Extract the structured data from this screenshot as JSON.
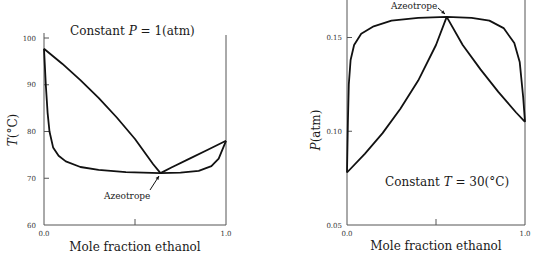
{
  "chart_data": [
    {
      "type": "line",
      "title": "Constant P = 1(atm)",
      "title_parts": {
        "prefix": "Constant ",
        "var": "P",
        "rest": " = 1(atm)"
      },
      "xlabel": "Mole fraction ethanol",
      "ylabel": "T(°C)",
      "ylabel_parts": {
        "var": "T",
        "unit": "(°C)"
      },
      "xlim": [
        0.0,
        1.0
      ],
      "ylim": [
        60,
        100
      ],
      "xticks": [
        "0.0",
        "1.0"
      ],
      "yticks": [
        "60",
        "70",
        "80",
        "90",
        "100"
      ],
      "grid": false,
      "annotation": {
        "text": "Azeotrope",
        "x": 0.64,
        "y": 71.1
      },
      "series": [
        {
          "name": "Dew point (vapor) curve",
          "x": [
            0.0,
            0.1,
            0.2,
            0.3,
            0.4,
            0.5,
            0.6,
            0.64,
            0.7,
            0.8,
            0.9,
            1.0
          ],
          "y": [
            97.7,
            94.5,
            91.0,
            87.2,
            83.0,
            78.4,
            73.0,
            71.1,
            72.3,
            74.2,
            76.1,
            78.0
          ]
        },
        {
          "name": "Bubble point (liquid) curve",
          "x": [
            0.0,
            0.01,
            0.02,
            0.03,
            0.05,
            0.08,
            0.12,
            0.2,
            0.3,
            0.45,
            0.64,
            0.75,
            0.85,
            0.92,
            0.96,
            1.0
          ],
          "y": [
            97.7,
            90.0,
            84.0,
            80.0,
            76.6,
            74.8,
            73.6,
            72.4,
            71.8,
            71.3,
            71.1,
            71.2,
            71.6,
            72.6,
            74.2,
            78.0
          ]
        }
      ]
    },
    {
      "type": "line",
      "title": "Constant T = 30(°C)",
      "title_parts": {
        "prefix": "Constant ",
        "var": "T",
        "rest": " = 30(°C)"
      },
      "xlabel": "Mole fraction ethanol",
      "ylabel": "P(atm)",
      "ylabel_parts": {
        "var": "P",
        "unit": "(atm)"
      },
      "xlim": [
        0.0,
        1.0
      ],
      "ylim": [
        0.05,
        0.16
      ],
      "xticks": [
        "0.0",
        "1.0"
      ],
      "yticks": [
        "0.05",
        "0.10",
        "0.15"
      ],
      "grid": false,
      "annotation": {
        "text": "Azeotrope",
        "x": 0.56,
        "y": 0.161
      },
      "series": [
        {
          "name": "Bubble point (liquid) curve",
          "x": [
            0.0,
            0.005,
            0.01,
            0.02,
            0.04,
            0.08,
            0.15,
            0.25,
            0.4,
            0.56,
            0.7,
            0.8,
            0.88,
            0.94,
            0.97,
            0.99,
            1.0
          ],
          "y": [
            0.078,
            0.105,
            0.125,
            0.138,
            0.146,
            0.152,
            0.156,
            0.159,
            0.1605,
            0.161,
            0.1605,
            0.159,
            0.155,
            0.147,
            0.137,
            0.118,
            0.105
          ]
        },
        {
          "name": "Dew point (vapor) curve",
          "x": [
            0.0,
            0.1,
            0.2,
            0.3,
            0.4,
            0.5,
            0.56,
            0.65,
            0.75,
            0.85,
            0.95,
            1.0
          ],
          "y": [
            0.078,
            0.088,
            0.099,
            0.112,
            0.127,
            0.146,
            0.161,
            0.146,
            0.133,
            0.121,
            0.11,
            0.105
          ]
        }
      ]
    }
  ]
}
